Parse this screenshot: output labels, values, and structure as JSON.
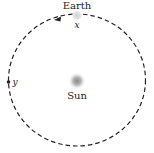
{
  "diagram": {
    "labels": {
      "earth": "Earth",
      "sun": "Sun",
      "point_x": "x",
      "point_y": "y"
    },
    "orbit": {
      "style": "dashed",
      "direction": "counterclockwise"
    },
    "colors": {
      "orbit": "#222222",
      "sun_glow": "#8a8a8a",
      "earth": "#d9d9d9",
      "text": "#222222"
    }
  }
}
